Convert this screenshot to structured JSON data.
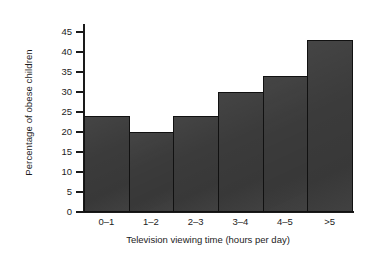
{
  "chart_data": {
    "type": "bar",
    "title": "",
    "subtitle": "",
    "xlabel": "Television viewing time (hours per day)",
    "ylabel": "Percentage of obese children",
    "categories": [
      "0–1",
      "1–2",
      "2–3",
      "3–4",
      "4–5",
      ">5"
    ],
    "values": [
      24,
      20,
      24,
      30,
      34,
      43
    ],
    "series": [
      {
        "name": "Percentage of obese children",
        "values": [
          24,
          20,
          24,
          30,
          34,
          43
        ]
      }
    ],
    "ylim": [
      0,
      47
    ],
    "yticks": [
      0,
      5,
      10,
      15,
      20,
      25,
      30,
      35,
      40,
      45
    ],
    "ytick_labels": [
      "0",
      "5",
      "10",
      "15",
      "20",
      "25",
      "30",
      "35",
      "40",
      "45"
    ],
    "grid": false,
    "legend": false,
    "legend_position": "none",
    "bar_color": "#3b3b3b",
    "bar_edge_color": "#111111",
    "background_color": "#ffffff",
    "text_color": "#1c1c1c",
    "annotations": []
  }
}
